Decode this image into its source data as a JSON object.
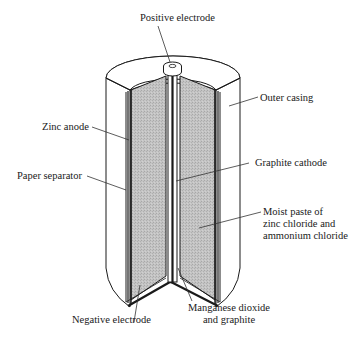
{
  "diagram": {
    "type": "cutaway",
    "labels": {
      "positive_electrode": "Positive electrode",
      "outer_casing": "Outer casing",
      "zinc_anode": "Zinc anode",
      "graphite_cathode": "Graphite cathode",
      "paper_separator": "Paper separator",
      "moist_paste_line1": "Moist paste of",
      "moist_paste_line2": "zinc chloride and",
      "moist_paste_line3": "ammonium chloride",
      "negative_electrode": "Negative electrode",
      "manganese_line1": "Manganese dioxide",
      "manganese_line2": "and graphite"
    },
    "colors": {
      "line": "#1a1a1a",
      "fill_paste": "#bdbdbd",
      "background": "#ffffff"
    }
  }
}
